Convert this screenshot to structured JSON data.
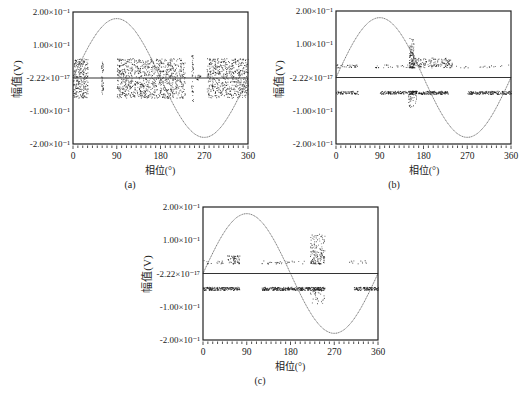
{
  "figure": {
    "panels": [
      {
        "id": "a",
        "caption": "(a)",
        "xlabel": "相位(°)",
        "ylabel": "幅值(V)"
      },
      {
        "id": "b",
        "caption": "(b)",
        "xlabel": "相位(°)",
        "ylabel": "幅值(V)"
      },
      {
        "id": "c",
        "caption": "(c)",
        "xlabel": "相位(°)",
        "ylabel": "幅值(V)"
      }
    ]
  },
  "chart_data": [
    {
      "type": "scatter",
      "title": "(a)",
      "xlabel": "相位(°)",
      "ylabel": "幅值(V)",
      "xlim": [
        0,
        360
      ],
      "ylim": [
        -0.2,
        0.2
      ],
      "x_ticks": [
        "0",
        "90",
        "180",
        "270",
        "360"
      ],
      "y_ticks": [
        {
          "value": 0.2,
          "label": "2.00×10⁻¹"
        },
        {
          "value": 0.1,
          "label": "1.00×10⁻¹"
        },
        {
          "value": 0.0,
          "label": "-2.22×10⁻¹⁷"
        },
        {
          "value": -0.1,
          "label": "-1.00×10⁻¹"
        },
        {
          "value": -0.2,
          "label": "-2.00×10⁻¹"
        }
      ],
      "grid": false,
      "reference_sine": {
        "amplitude": 0.18,
        "period_deg": 360
      },
      "zero_line": true,
      "clusters": [
        {
          "x": [
            0,
            30
          ],
          "y": [
            -0.06,
            0.06
          ],
          "n": 260
        },
        {
          "x": [
            58,
            62
          ],
          "y": [
            -0.05,
            0.05
          ],
          "n": 40
        },
        {
          "x": [
            90,
            230
          ],
          "y": [
            -0.06,
            0.06
          ],
          "n": 900
        },
        {
          "x": [
            243,
            247
          ],
          "y": [
            -0.07,
            0.07
          ],
          "n": 40
        },
        {
          "x": [
            250,
            262
          ],
          "y": [
            -0.005,
            0.01
          ],
          "n": 20
        },
        {
          "x": [
            275,
            360
          ],
          "y": [
            -0.06,
            0.06
          ],
          "n": 560
        }
      ]
    },
    {
      "type": "scatter",
      "title": "(b)",
      "xlabel": "相位(°)",
      "ylabel": "幅值(V)",
      "xlim": [
        0,
        360
      ],
      "ylim": [
        -0.2,
        0.2
      ],
      "x_ticks": [
        "0",
        "90",
        "180",
        "270",
        "360"
      ],
      "y_ticks": [
        {
          "value": 0.2,
          "label": "2.00×10⁻¹"
        },
        {
          "value": 0.1,
          "label": "1.00×10⁻¹"
        },
        {
          "value": 0.0,
          "label": "-2.22×10⁻¹⁷"
        },
        {
          "value": -0.1,
          "label": "-1.00×10⁻¹"
        },
        {
          "value": -0.2,
          "label": "-2.00×10⁻¹"
        }
      ],
      "grid": false,
      "reference_sine": {
        "amplitude": 0.18,
        "period_deg": 360
      },
      "zero_line": true,
      "clusters": [
        {
          "x": [
            0,
            45
          ],
          "y": [
            0.03,
            0.04
          ],
          "n": 30
        },
        {
          "x": [
            80,
            150
          ],
          "y": [
            0.03,
            0.04
          ],
          "n": 25
        },
        {
          "x": [
            150,
            160
          ],
          "y": [
            0.03,
            0.12
          ],
          "n": 120
        },
        {
          "x": [
            160,
            240
          ],
          "y": [
            0.03,
            0.06
          ],
          "n": 160
        },
        {
          "x": [
            240,
            360
          ],
          "y": [
            0.03,
            0.04
          ],
          "n": 20
        },
        {
          "x": [
            0,
            45
          ],
          "y": [
            -0.05,
            -0.04
          ],
          "n": 70
        },
        {
          "x": [
            90,
            230
          ],
          "y": [
            -0.05,
            -0.04
          ],
          "n": 300
        },
        {
          "x": [
            148,
            165
          ],
          "y": [
            -0.09,
            -0.04
          ],
          "n": 60
        },
        {
          "x": [
            270,
            360
          ],
          "y": [
            -0.05,
            -0.04
          ],
          "n": 180
        }
      ]
    },
    {
      "type": "scatter",
      "title": "(c)",
      "xlabel": "相位(°)",
      "ylabel": "幅值(V)",
      "xlim": [
        0,
        360
      ],
      "ylim": [
        -0.2,
        0.2
      ],
      "x_ticks": [
        "0",
        "90",
        "180",
        "270",
        "360"
      ],
      "y_ticks": [
        {
          "value": 0.2,
          "label": "2.00×10⁻¹"
        },
        {
          "value": 0.1,
          "label": "1.00×10⁻¹"
        },
        {
          "value": 0.0,
          "label": "-2.22×10⁻¹⁷"
        },
        {
          "value": -0.1,
          "label": "-1.00×10⁻¹"
        },
        {
          "value": -0.2,
          "label": "-2.00×10⁻¹"
        }
      ],
      "grid": false,
      "reference_sine": {
        "amplitude": 0.18,
        "period_deg": 360
      },
      "zero_line": true,
      "clusters": [
        {
          "x": [
            0,
            50
          ],
          "y": [
            0.03,
            0.04
          ],
          "n": 15
        },
        {
          "x": [
            50,
            75
          ],
          "y": [
            0.03,
            0.055
          ],
          "n": 60
        },
        {
          "x": [
            120,
            210
          ],
          "y": [
            0.03,
            0.04
          ],
          "n": 30
        },
        {
          "x": [
            220,
            250
          ],
          "y": [
            0.03,
            0.12
          ],
          "n": 150
        },
        {
          "x": [
            300,
            335
          ],
          "y": [
            0.03,
            0.04
          ],
          "n": 12
        },
        {
          "x": [
            0,
            75
          ],
          "y": [
            -0.05,
            -0.04
          ],
          "n": 180
        },
        {
          "x": [
            120,
            250
          ],
          "y": [
            -0.05,
            -0.04
          ],
          "n": 320
        },
        {
          "x": [
            220,
            250
          ],
          "y": [
            -0.09,
            -0.04
          ],
          "n": 50
        },
        {
          "x": [
            310,
            360
          ],
          "y": [
            -0.05,
            -0.04
          ],
          "n": 110
        }
      ]
    }
  ]
}
